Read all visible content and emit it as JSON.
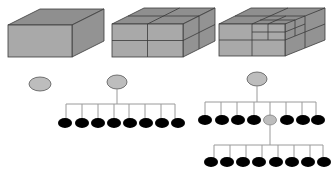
{
  "diagram": {
    "colors": {
      "box_front": "#a9a9a9",
      "box_top": "#8f8f8f",
      "box_side": "#939393",
      "edge": "#3a3a3a",
      "root_node": "#bdbdbd",
      "leaf_node": "#000000",
      "connector": "#9a9a9a"
    },
    "panels": [
      {
        "id": "panel-1",
        "label": "undivided cube",
        "tree_levels": 1,
        "root_nodes": 1,
        "leaf_nodes": 0
      },
      {
        "id": "panel-2",
        "label": "cube divided into 8 octants",
        "tree_levels": 2,
        "root_nodes": 1,
        "leaf_nodes": 8
      },
      {
        "id": "panel-3",
        "label": "cube with one octant subdivided again",
        "tree_levels": 3,
        "root_nodes": 1,
        "leaf_nodes": 15,
        "internal_nodes": 1
      }
    ]
  }
}
